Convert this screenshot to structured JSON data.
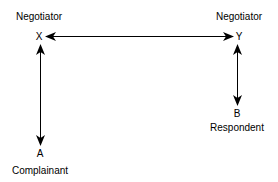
{
  "diagram": {
    "nodes": [
      {
        "id": "X",
        "letter": "X",
        "role": "Negotiator",
        "role_position": "above"
      },
      {
        "id": "Y",
        "letter": "Y",
        "role": "Negotiator",
        "role_position": "above"
      },
      {
        "id": "A",
        "letter": "A",
        "role": "Complainant",
        "role_position": "below"
      },
      {
        "id": "B",
        "letter": "B",
        "role": "Respondent",
        "role_position": "below"
      }
    ],
    "edges": [
      {
        "from": "X",
        "to": "Y",
        "type": "bidirectional"
      },
      {
        "from": "X",
        "to": "A",
        "type": "bidirectional"
      },
      {
        "from": "Y",
        "to": "B",
        "type": "bidirectional"
      }
    ],
    "colors": {
      "line": "#000000",
      "background": "#ffffff"
    }
  }
}
